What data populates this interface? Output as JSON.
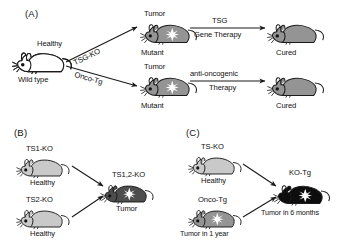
{
  "figure": {
    "type": "scientific-diagram",
    "panels": [
      {
        "id": "A",
        "label": "(A)",
        "description": "Wild type mouse gives rise to mutant tumor-bearing mice via TSG knockout or oncogene transgene; each is cured by a corresponding therapy.",
        "mice": [
          {
            "name": "wild-type-mouse",
            "top_label": "Healthy",
            "bottom_label": "Wild type",
            "shade": "white",
            "tumor": false
          },
          {
            "name": "tsg-ko-mutant-mouse",
            "top_label": "Tumor",
            "bottom_label": "Mutant",
            "shade": "mid-gray",
            "tumor": true
          },
          {
            "name": "onco-tg-mutant-mouse",
            "top_label": "Tumor",
            "bottom_label": "Mutant",
            "shade": "mid-gray",
            "tumor": true
          },
          {
            "name": "cured-mouse-top",
            "top_label": "",
            "bottom_label": "Cured",
            "shade": "mid-gray",
            "tumor": false
          },
          {
            "name": "cured-mouse-bottom",
            "top_label": "",
            "bottom_label": "Cured",
            "shade": "mid-gray",
            "tumor": false
          }
        ],
        "arrows": [
          {
            "name": "arrow-tsg-ko",
            "label": "TSG-KO",
            "style": "diagonal-up"
          },
          {
            "name": "arrow-onco-tg",
            "label": "Onco-Tg",
            "style": "diagonal-down"
          },
          {
            "name": "arrow-tsg-gene-therapy",
            "label_above": "TSG",
            "label_below": "Gene Therapy",
            "style": "horizontal"
          },
          {
            "name": "arrow-anti-oncogenic-therapy",
            "label_above": "anti-oncogenic",
            "label_below": "Therapy",
            "style": "horizontal"
          }
        ]
      },
      {
        "id": "B",
        "label": "(B)",
        "description": "Two single tumor-suppressor knockout mice are healthy; the double knockout develops tumor.",
        "mice": [
          {
            "name": "ts1-ko-mouse",
            "top_label": "TS1-KO",
            "bottom_label": "Healthy",
            "shade": "light-gray",
            "tumor": false
          },
          {
            "name": "ts2-ko-mouse",
            "top_label": "TS2-KO",
            "bottom_label": "Healthy",
            "shade": "light-gray",
            "tumor": false
          },
          {
            "name": "ts12-ko-mouse",
            "top_label": "TS1,2-KO",
            "bottom_label": "Tumor",
            "shade": "dark-gray",
            "tumor": true
          }
        ],
        "arrows": [
          {
            "name": "arrow-ts1-to-double",
            "label": "",
            "style": "diagonal-down"
          },
          {
            "name": "arrow-ts2-to-double",
            "label": "",
            "style": "diagonal-up"
          }
        ]
      },
      {
        "id": "C",
        "label": "(C)",
        "description": "A healthy TS-KO mouse crossed with an Onco-Tg mouse that gets tumor in 1 year yields a KO-Tg mouse with tumor in 6 months.",
        "mice": [
          {
            "name": "ts-ko-mouse",
            "top_label": "TS-KO",
            "bottom_label": "Healthy",
            "shade": "light-gray",
            "tumor": false
          },
          {
            "name": "onco-tg-mouse",
            "top_label": "Onco-Tg",
            "bottom_label": "Tumor in 1 year",
            "shade": "mid-gray",
            "tumor": true
          },
          {
            "name": "ko-tg-mouse",
            "top_label": "KO-Tg",
            "bottom_label": "Tumor in 6 months",
            "shade": "black",
            "tumor": true
          }
        ],
        "arrows": [
          {
            "name": "arrow-tsko-to-kotg",
            "label": "",
            "style": "diagonal-down"
          },
          {
            "name": "arrow-oncotg-to-kotg",
            "label": "",
            "style": "diagonal-up"
          }
        ]
      }
    ],
    "colors": {
      "white_mouse": "#ffffff",
      "light_gray_mouse": "#c9c9c9",
      "mid_gray_mouse": "#949494",
      "dark_gray_mouse": "#4d4d4d",
      "black_mouse": "#0d0d0d",
      "outline": "#1a1a1a",
      "tumor_marker": "#ffffff",
      "text": "#111111"
    }
  }
}
